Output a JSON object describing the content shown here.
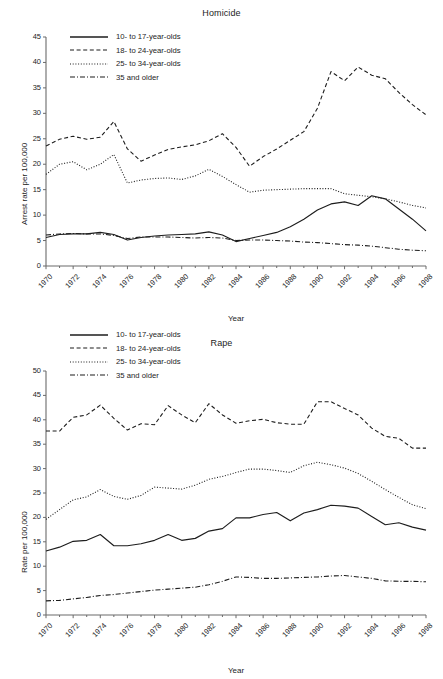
{
  "page": {
    "background": "#ffffff",
    "line_color": "#1d1d1d",
    "axis_color": "#6b6b6b"
  },
  "figures": [
    {
      "id": "homicide",
      "title": "Homicide",
      "xlabel": "Year",
      "ylabel": "Arrest rate per 100,000"
    },
    {
      "id": "rape",
      "title": "Rape",
      "xlabel": "Year",
      "ylabel": "Rate per 100,000"
    }
  ],
  "legend": {
    "items": [
      {
        "label": "10- to 17-year-olds",
        "style": "solid"
      },
      {
        "label": "18- to 24-year-olds",
        "style": "dashed"
      },
      {
        "label": "25- to 34-year-olds",
        "style": "dotted"
      },
      {
        "label": "35 and older",
        "style": "dashdot"
      }
    ]
  },
  "chart_data": [
    {
      "type": "line",
      "title": "Homicide",
      "xlabel": "Year",
      "ylabel": "Arrest rate per 100,000",
      "xlim": [
        1970,
        1998
      ],
      "ylim": [
        0,
        45
      ],
      "yticks": [
        0,
        5,
        10,
        15,
        20,
        25,
        30,
        35,
        40,
        45
      ],
      "xticks": [
        1970,
        1972,
        1974,
        1976,
        1978,
        1980,
        1982,
        1984,
        1986,
        1988,
        1990,
        1992,
        1994,
        1996,
        1998
      ],
      "grid": false,
      "legend_position": "upper-left",
      "x": [
        1970,
        1971,
        1972,
        1973,
        1974,
        1975,
        1976,
        1977,
        1978,
        1979,
        1980,
        1981,
        1982,
        1983,
        1984,
        1985,
        1986,
        1987,
        1988,
        1989,
        1990,
        1991,
        1992,
        1993,
        1994,
        1995,
        1996,
        1997,
        1998
      ],
      "series": [
        {
          "name": "10- to 17-year-olds",
          "style": "solid",
          "values": [
            5.6,
            6.2,
            6.3,
            6.3,
            6.6,
            6.2,
            5.1,
            5.6,
            5.9,
            6.1,
            6.2,
            6.3,
            6.7,
            6.1,
            4.8,
            5.4,
            6.0,
            6.6,
            7.7,
            9.2,
            11.0,
            12.2,
            12.6,
            11.9,
            13.8,
            13.2,
            11.2,
            9.2,
            6.9
          ]
        },
        {
          "name": "18- to 24-year-olds",
          "style": "dashed",
          "values": [
            23.6,
            24.9,
            25.5,
            24.9,
            25.3,
            28.4,
            23.0,
            20.6,
            21.8,
            22.9,
            23.4,
            23.8,
            24.6,
            26.0,
            23.3,
            19.6,
            21.5,
            23.0,
            24.7,
            26.4,
            31.0,
            38.2,
            36.4,
            39.1,
            37.5,
            36.8,
            34.1,
            31.7,
            29.7
          ]
        },
        {
          "name": "25- to 34-year-olds",
          "style": "dotted",
          "values": [
            18.0,
            20.0,
            20.5,
            18.9,
            20.0,
            21.9,
            16.3,
            16.9,
            17.2,
            17.3,
            17.0,
            17.7,
            19.0,
            17.6,
            16.0,
            14.5,
            14.9,
            15.0,
            15.1,
            15.2,
            15.2,
            15.2,
            14.2,
            13.9,
            13.6,
            13.2,
            12.6,
            11.9,
            11.4
          ]
        },
        {
          "name": "35 and older",
          "style": "dashdot",
          "values": [
            6.1,
            6.3,
            6.4,
            6.3,
            6.3,
            6.0,
            5.4,
            5.7,
            5.7,
            5.7,
            5.6,
            5.5,
            5.6,
            5.5,
            5.0,
            5.1,
            5.1,
            5.0,
            4.9,
            4.7,
            4.6,
            4.4,
            4.2,
            4.1,
            3.9,
            3.6,
            3.3,
            3.1,
            3.0
          ]
        }
      ]
    },
    {
      "type": "line",
      "title": "Rape",
      "xlabel": "Year",
      "ylabel": "Rate per 100,000",
      "xlim": [
        1970,
        1998
      ],
      "ylim": [
        0,
        50
      ],
      "yticks": [
        0,
        5,
        10,
        15,
        20,
        25,
        30,
        35,
        40,
        45,
        50
      ],
      "xticks": [
        1970,
        1972,
        1974,
        1976,
        1978,
        1980,
        1982,
        1984,
        1986,
        1988,
        1990,
        1992,
        1994,
        1996,
        1998
      ],
      "grid": false,
      "legend_position": "upper-left",
      "x": [
        1970,
        1971,
        1972,
        1973,
        1974,
        1975,
        1976,
        1977,
        1978,
        1979,
        1980,
        1981,
        1982,
        1983,
        1984,
        1985,
        1986,
        1987,
        1988,
        1989,
        1990,
        1991,
        1992,
        1993,
        1994,
        1995,
        1996,
        1997,
        1998
      ],
      "series": [
        {
          "name": "10- to 17-year-olds",
          "style": "solid",
          "values": [
            13.1,
            13.9,
            15.1,
            15.3,
            16.5,
            14.2,
            14.2,
            14.6,
            15.3,
            16.5,
            15.3,
            15.7,
            17.2,
            17.7,
            19.9,
            19.9,
            20.6,
            21.0,
            19.3,
            20.9,
            21.6,
            22.5,
            22.3,
            21.9,
            20.2,
            18.5,
            18.9,
            18.0,
            17.4
          ]
        },
        {
          "name": "18- to 24-year-olds",
          "style": "dashed",
          "values": [
            37.7,
            37.7,
            40.5,
            41.0,
            43.0,
            40.3,
            37.9,
            39.2,
            39.0,
            42.9,
            41.0,
            39.4,
            43.3,
            41.0,
            39.3,
            39.8,
            40.1,
            39.4,
            39.1,
            39.1,
            43.7,
            43.7,
            42.3,
            41.0,
            38.3,
            36.6,
            36.2,
            34.2,
            34.2
          ]
        },
        {
          "name": "25- to 34-year-olds",
          "style": "dotted",
          "values": [
            19.6,
            21.6,
            23.6,
            24.2,
            25.7,
            24.3,
            23.7,
            24.5,
            26.2,
            26.0,
            25.8,
            26.6,
            27.8,
            28.4,
            29.2,
            29.9,
            29.9,
            29.6,
            29.2,
            30.6,
            31.3,
            30.8,
            30.1,
            29.0,
            27.4,
            25.7,
            24.1,
            22.6,
            21.8
          ]
        },
        {
          "name": "35 and older",
          "style": "dashdot",
          "values": [
            2.9,
            3.0,
            3.3,
            3.6,
            4.0,
            4.2,
            4.5,
            4.8,
            5.1,
            5.3,
            5.5,
            5.7,
            6.2,
            6.9,
            7.8,
            7.7,
            7.5,
            7.5,
            7.6,
            7.7,
            7.8,
            8.0,
            8.1,
            7.8,
            7.5,
            7.0,
            6.9,
            6.9,
            6.8
          ]
        }
      ]
    }
  ]
}
